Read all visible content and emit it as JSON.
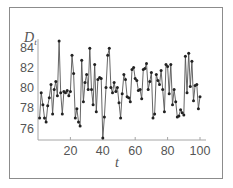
{
  "chart_data": {
    "type": "line",
    "title": "",
    "xlabel": "t",
    "ylabel": "D_t",
    "ylabel_main": "D",
    "ylabel_sub": "t",
    "xlim": [
      0,
      101
    ],
    "ylim": [
      75,
      85
    ],
    "x_ticks": [
      20,
      40,
      60,
      80,
      100
    ],
    "y_ticks": [
      76,
      78,
      80,
      82,
      84
    ],
    "grid": false,
    "legend": null,
    "marker": "circle",
    "line_color": "#555555",
    "marker_color": "#222222",
    "x": [
      1,
      2,
      3,
      4,
      5,
      6,
      7,
      8,
      9,
      10,
      11,
      12,
      13,
      14,
      15,
      16,
      17,
      18,
      19,
      20,
      21,
      22,
      23,
      24,
      25,
      26,
      27,
      28,
      29,
      30,
      31,
      32,
      33,
      34,
      35,
      36,
      37,
      38,
      39,
      40,
      41,
      42,
      43,
      44,
      45,
      46,
      47,
      48,
      49,
      50,
      51,
      52,
      53,
      54,
      55,
      56,
      57,
      58,
      59,
      60,
      61,
      62,
      63,
      64,
      65,
      66,
      67,
      68,
      69,
      70,
      71,
      72,
      73,
      74,
      75,
      76,
      77,
      78,
      79,
      80,
      81,
      82,
      83,
      84,
      85,
      86,
      87,
      88,
      89,
      90,
      91,
      92,
      93,
      94,
      95,
      96,
      97,
      98,
      99,
      100
    ],
    "values": [
      77.0,
      79.5,
      78.3,
      77.0,
      76.6,
      78.2,
      79.0,
      80.3,
      77.4,
      79.8,
      80.6,
      79.2,
      84.6,
      79.5,
      77.4,
      79.6,
      79.5,
      79.7,
      79.2,
      79.6,
      83.2,
      81.4,
      77.0,
      77.9,
      76.6,
      76.2,
      82.7,
      78.6,
      80.5,
      81.3,
      79.8,
      83.9,
      79.8,
      78.3,
      82.3,
      77.6,
      80.8,
      81.0,
      80.9,
      75.0,
      77.1,
      80.0,
      83.2,
      83.9,
      80.0,
      79.5,
      80.5,
      79.6,
      80.0,
      78.5,
      77.0,
      79.4,
      81.3,
      80.8,
      79.1,
      79.0,
      78.6,
      81.8,
      82.0,
      80.9,
      80.7,
      79.7,
      79.8,
      78.9,
      81.8,
      81.9,
      82.4,
      79.8,
      80.6,
      81.5,
      77.0,
      77.4,
      81.3,
      80.7,
      80.3,
      81.7,
      79.8,
      77.6,
      82.3,
      82.1,
      79.4,
      82.3,
      78.3,
      79.8,
      78.6,
      77.1,
      77.2,
      77.8,
      77.5,
      77.3,
      83.1,
      79.5,
      83.4,
      80.1,
      82.6,
      78.7,
      80.2,
      80.3,
      77.9,
      79.1
    ]
  }
}
